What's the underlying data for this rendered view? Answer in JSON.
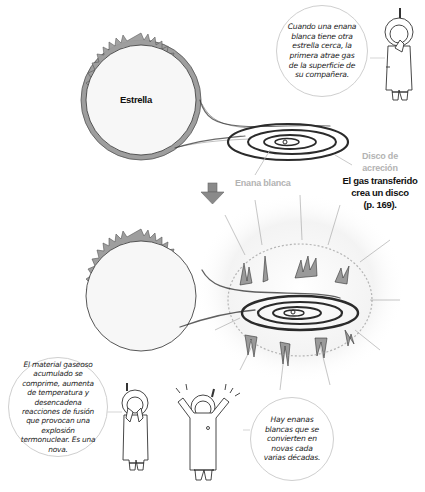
{
  "panel1": {
    "star_label": "Estrella",
    "white_dwarf_label": "Enana blanca",
    "disk_label_line1": "Disco de",
    "disk_label_line2": "acreción",
    "caption_line1": "El gas transferido",
    "caption_line2": "crea un disco",
    "caption_line3": "(p. 169).",
    "speech": "Cuando una enana blanca tiene otra estrella cerca, la primera atrae gas de la superficie de su compañera."
  },
  "arrow": {
    "icon": "down-arrow-icon",
    "color": "#8a8a8a"
  },
  "panel2": {
    "speech_left": "El material gaseoso acumulado se comprime, aumenta de temperatura y desencadena reacciones de fusión que provocan una explosión termonuclear. Es una nova.",
    "speech_right": "Hay enanas blancas que se convierten en novas cada varias décadas."
  },
  "colors": {
    "star_rim": "#9e9e9e",
    "star_fill": "#f7f7f7",
    "disk_stroke": "#2b2b2b",
    "label_grey": "#b3b3b3",
    "bubble_border": "#cfcfcf"
  }
}
